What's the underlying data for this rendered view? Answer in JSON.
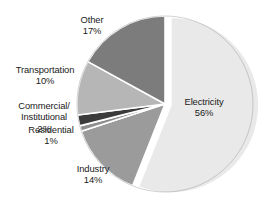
{
  "chart_data": {
    "type": "pie",
    "title": "",
    "categories": [
      "Electricity",
      "Other",
      "Transportation",
      "Commercial/Institutional",
      "Residential",
      "Industry"
    ],
    "values": [
      56,
      17,
      10,
      2,
      1,
      14
    ],
    "unit": "%",
    "legend": "none",
    "grid": false,
    "slices": [
      {
        "label": "Electricity",
        "value": 56,
        "value_text": "56%",
        "color": "#e9e9e9",
        "exploded": true
      },
      {
        "label": "Other",
        "value": 17,
        "value_text": "17%",
        "color": "#7c7c7c",
        "exploded": false
      },
      {
        "label": "Transportation",
        "value": 10,
        "value_text": "10%",
        "color": "#b6b6b6",
        "exploded": false
      },
      {
        "label": "Commercial/Institutional",
        "value": 2,
        "value_text": "2%",
        "color": "#3b3b3b",
        "exploded": false
      },
      {
        "label": "Residential",
        "value": 1,
        "value_text": "1%",
        "color": "#8f8f8f",
        "exploded": false
      },
      {
        "label": "Industry",
        "value": 14,
        "value_text": "14%",
        "color": "#9b9b9b",
        "exploded": false
      }
    ]
  },
  "labels": {
    "other": {
      "name": "Other",
      "value": "17%"
    },
    "transport": {
      "name": "Transportation",
      "value": "10%"
    },
    "commercial": {
      "name_line1": "Commercial/",
      "name_line2": "Institutional",
      "value": "2%"
    },
    "residential": {
      "name": "Residential",
      "value": "1%"
    },
    "industry": {
      "name": "Industry",
      "value": "14%"
    },
    "electricity": {
      "name": "Electricity",
      "value": "56%"
    }
  },
  "colors": {
    "background": "#ffffff",
    "text": "#1a1a1a",
    "slice_outline": "#8a8a8a",
    "slice_divider": "#ffffff"
  }
}
